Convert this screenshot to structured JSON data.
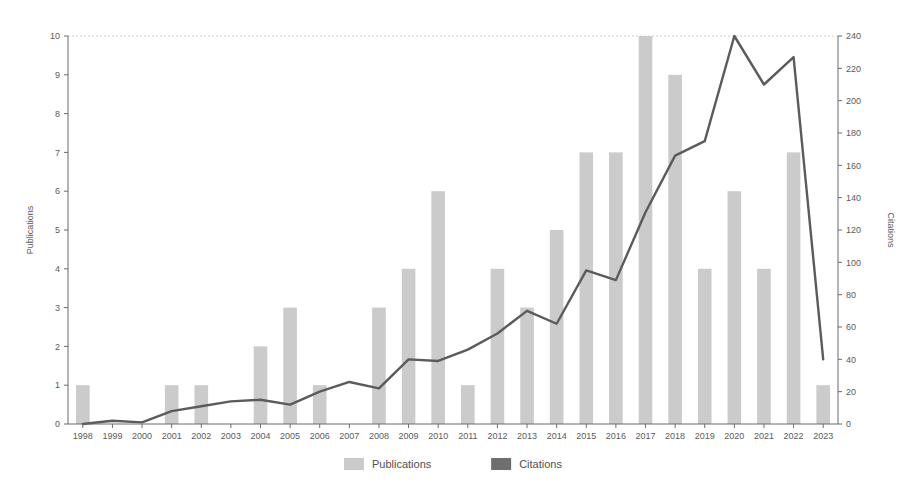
{
  "chart_data": {
    "type": "bar",
    "title": "",
    "subtitle": "",
    "xlabel": "",
    "ylabel": "Publications",
    "y2label": "Citations",
    "categories": [
      "1998",
      "1999",
      "2000",
      "2001",
      "2002",
      "2003",
      "2004",
      "2005",
      "2006",
      "2007",
      "2008",
      "2009",
      "2010",
      "2011",
      "2012",
      "2013",
      "2014",
      "2015",
      "2016",
      "2017",
      "2018",
      "2019",
      "2020",
      "2021",
      "2022",
      "2023"
    ],
    "ylim": [
      0,
      10
    ],
    "ytick_labels": [
      "0",
      "1",
      "2",
      "3",
      "4",
      "5",
      "6",
      "7",
      "8",
      "9",
      "10"
    ],
    "ytick_values": [
      0,
      1,
      2,
      3,
      4,
      5,
      6,
      7,
      8,
      9,
      10
    ],
    "y2lim": [
      0,
      240
    ],
    "y2tick_labels": [
      "0",
      "20",
      "40",
      "60",
      "80",
      "100",
      "120",
      "140",
      "160",
      "180",
      "200",
      "220",
      "240"
    ],
    "y2tick_values": [
      0,
      20,
      40,
      60,
      80,
      100,
      120,
      140,
      160,
      180,
      200,
      220,
      240
    ],
    "grid": false,
    "legend_position": "bottom",
    "series": [
      {
        "name": "Publications",
        "kind": "bar",
        "axis": "left",
        "color": "#cbcbcb",
        "values": [
          1,
          0,
          0,
          1,
          1,
          0,
          2,
          3,
          1,
          0,
          3,
          4,
          6,
          1,
          4,
          3,
          5,
          7,
          7,
          10,
          9,
          4,
          6,
          4,
          7,
          1
        ]
      },
      {
        "name": "Citations",
        "kind": "line",
        "axis": "right",
        "color": "#5b5b5b",
        "values": [
          0,
          2,
          1,
          8,
          11,
          14,
          15,
          12,
          20,
          26,
          22,
          40,
          39,
          46,
          56,
          70,
          62,
          95,
          89,
          131,
          166,
          175,
          240,
          210,
          227,
          40
        ]
      }
    ]
  },
  "legend": {
    "items": [
      {
        "label": "Publications",
        "swatch": "#cbcbcb"
      },
      {
        "label": "Citations",
        "swatch": "#6e6e6e"
      }
    ]
  },
  "axes": {
    "left_title": "Publications",
    "right_title": "Citations"
  },
  "colors": {
    "bar": "#cbcbcb",
    "line": "#5b5b5b",
    "axis": "#6b6b6b",
    "text": "#5a5a5a",
    "background": "#ffffff"
  }
}
